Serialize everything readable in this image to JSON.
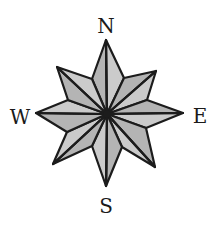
{
  "diagram": {
    "type": "compass-rose",
    "points": 8,
    "center": {
      "x": 107,
      "y": 114
    },
    "labels": {
      "north": "N",
      "south": "S",
      "east": "E",
      "west": "W"
    },
    "label_positions": {
      "north": {
        "x": 106,
        "y": 26
      },
      "south": {
        "x": 106,
        "y": 206
      },
      "east": {
        "x": 200,
        "y": 116
      },
      "west": {
        "x": 20,
        "y": 117
      }
    },
    "tips": {
      "N": {
        "x": 106,
        "y": 40
      },
      "NE": {
        "x": 156,
        "y": 71
      },
      "E": {
        "x": 183,
        "y": 113
      },
      "SE": {
        "x": 155,
        "y": 167
      },
      "S": {
        "x": 106,
        "y": 186
      },
      "SW": {
        "x": 53,
        "y": 164
      },
      "W": {
        "x": 36,
        "y": 113
      },
      "NW": {
        "x": 57,
        "y": 67
      }
    },
    "valleys": {
      "N_NE": {
        "x": 124,
        "y": 78
      },
      "NE_E": {
        "x": 147,
        "y": 100
      },
      "E_SE": {
        "x": 146,
        "y": 128
      },
      "SE_S": {
        "x": 122,
        "y": 147
      },
      "S_SW": {
        "x": 92,
        "y": 146
      },
      "SW_W": {
        "x": 67,
        "y": 132
      },
      "W_NW": {
        "x": 68,
        "y": 100
      },
      "NW_N": {
        "x": 92,
        "y": 79
      }
    },
    "colors": {
      "fill_dark": "#b4b4b4",
      "fill_light": "#cbcbcb",
      "outline": "#1c1c1c",
      "background": "#ffffff"
    }
  }
}
